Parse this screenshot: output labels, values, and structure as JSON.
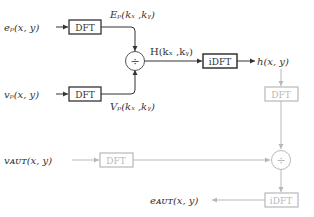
{
  "colors": {
    "dark": "#333333",
    "light": "#b8b8b8"
  },
  "inputs": {
    "ep": "eₚ(x, y)",
    "vp": "vₚ(x, y)",
    "vaut": "vᴀᴜᴛ(x, y)",
    "eaut": "eᴀᴜᴛ(x, y)"
  },
  "signals": {
    "Ep": "Eₚ(kₓ ,kᵧ)",
    "Vp": "Vₚ(kₓ ,kᵧ)",
    "H": "H(kₓ ,kᵧ)",
    "h": "h(x, y)"
  },
  "blocks": {
    "dft_ep": "DFT",
    "dft_vp": "DFT",
    "idft_top": "iDFT",
    "dft_h": "DFT",
    "dft_vaut": "DFT",
    "idft_bottom": "iDFT",
    "divide_top": "÷",
    "divide_bottom": "÷"
  }
}
